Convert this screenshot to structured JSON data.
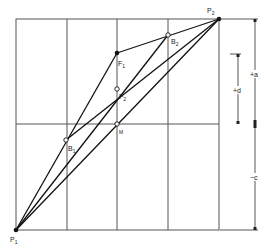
{
  "diagram": {
    "grid": {
      "left": 16,
      "right": 219,
      "top": 19,
      "bottom": 230,
      "vertical_lines": [
        67,
        117,
        168
      ],
      "horizontal_lines": [
        124
      ],
      "stroke": "#555555"
    },
    "points": {
      "P1": {
        "label": "P",
        "sub": "1",
        "x": 16,
        "y": 230,
        "style": "filled"
      },
      "P2": {
        "label": "P",
        "sub": "2",
        "x": 219,
        "y": 19,
        "style": "filled"
      },
      "F1": {
        "label": "F",
        "sub": "1",
        "x": 117,
        "y": 53,
        "style": "filled"
      },
      "F2": {
        "label": "F",
        "sub": "2",
        "x": 117,
        "y": 89,
        "style": "open"
      },
      "B1": {
        "label": "B",
        "sub": "1",
        "x": 66,
        "y": 140,
        "style": "open"
      },
      "B2": {
        "label": "B",
        "sub": "2",
        "x": 168,
        "y": 35,
        "style": "open"
      },
      "M": {
        "label": "M",
        "sub": "",
        "x": 117,
        "y": 124,
        "style": "open"
      }
    },
    "lines": [
      [
        "P1",
        "F1"
      ],
      [
        "F1",
        "P2"
      ],
      [
        "P1",
        "B2"
      ],
      [
        "B1",
        "P2"
      ],
      [
        "P1",
        "P2"
      ]
    ],
    "dimensions": {
      "a": {
        "label": "+a",
        "x": 255,
        "y1": 19,
        "y2": 124
      },
      "d": {
        "label": "+d",
        "x": 238,
        "y1": 54,
        "y2": 124
      },
      "c": {
        "label": "−c",
        "x": 255,
        "y1": 124,
        "y2": 230
      }
    },
    "labels": {
      "P1": "P",
      "P1_sub": "1",
      "P2": "P",
      "P2_sub": "2",
      "F1": "F",
      "F1_sub": "1",
      "F2": "F",
      "F2_sub": "2",
      "B1": "B",
      "B1_sub": "1",
      "B2": "B",
      "B2_sub": "2",
      "M": "M",
      "dim_a": "+a",
      "dim_d": "+d",
      "dim_c": "−c"
    }
  }
}
